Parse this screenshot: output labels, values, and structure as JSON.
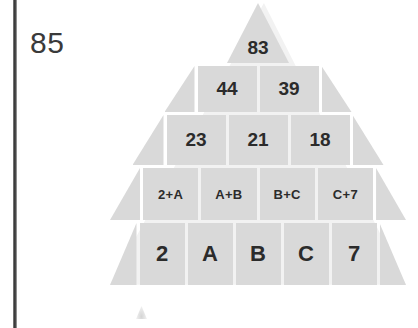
{
  "page": {
    "question_number": "85",
    "colors": {
      "cell_fill": "#d9d9d9",
      "text": "#2b2b2b",
      "rule": "#3a3a3a",
      "background": "#ffffff"
    }
  },
  "chart_data": {
    "type": "diagram",
    "diagram_kind": "number-pyramid",
    "title": "",
    "rows": [
      {
        "index": 0,
        "level": "apex",
        "cells": [
          "83"
        ]
      },
      {
        "index": 1,
        "level": "second",
        "cells": [
          "44",
          "39"
        ]
      },
      {
        "index": 2,
        "level": "third",
        "cells": [
          "23",
          "21",
          "18"
        ]
      },
      {
        "index": 3,
        "level": "fourth",
        "cells": [
          "2+A",
          "A+B",
          "B+C",
          "C+7"
        ]
      },
      {
        "index": 4,
        "level": "base",
        "cells": [
          "2",
          "A",
          "B",
          "C",
          "7"
        ]
      }
    ],
    "unknowns": [
      "A",
      "B",
      "C"
    ],
    "known_base_values": {
      "first": "2",
      "last": "7"
    }
  }
}
